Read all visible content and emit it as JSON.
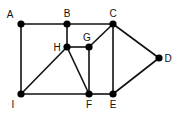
{
  "diagram": {
    "type": "graph",
    "nodes": [
      {
        "id": "A",
        "label": "A",
        "x": 21,
        "y": 24,
        "lx": 10,
        "ly": 18
      },
      {
        "id": "B",
        "label": "B",
        "x": 67,
        "y": 24,
        "lx": 67,
        "ly": 17
      },
      {
        "id": "C",
        "label": "C",
        "x": 113,
        "y": 24,
        "lx": 113,
        "ly": 17
      },
      {
        "id": "D",
        "label": "D",
        "x": 159,
        "y": 58,
        "lx": 168,
        "ly": 62
      },
      {
        "id": "E",
        "label": "E",
        "x": 113,
        "y": 94,
        "lx": 113,
        "ly": 108
      },
      {
        "id": "F",
        "label": "F",
        "x": 89,
        "y": 94,
        "lx": 89,
        "ly": 108
      },
      {
        "id": "G",
        "label": "G",
        "x": 89,
        "y": 47,
        "lx": 87,
        "ly": 41
      },
      {
        "id": "H",
        "label": "H",
        "x": 67,
        "y": 47,
        "lx": 57,
        "ly": 51
      },
      {
        "id": "I",
        "label": "I",
        "x": 21,
        "y": 94,
        "lx": 13,
        "ly": 108
      }
    ],
    "edges": [
      [
        "A",
        "B"
      ],
      [
        "B",
        "C"
      ],
      [
        "A",
        "I"
      ],
      [
        "B",
        "H"
      ],
      [
        "H",
        "G"
      ],
      [
        "G",
        "C"
      ],
      [
        "C",
        "E"
      ],
      [
        "C",
        "D"
      ],
      [
        "D",
        "E"
      ],
      [
        "I",
        "F"
      ],
      [
        "F",
        "E"
      ],
      [
        "I",
        "H"
      ],
      [
        "H",
        "F"
      ],
      [
        "G",
        "F"
      ]
    ]
  }
}
